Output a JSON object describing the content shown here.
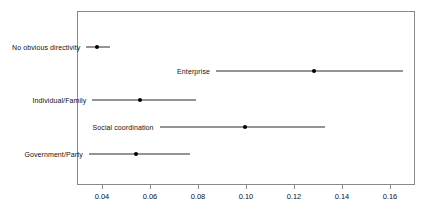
{
  "chart_data": {
    "type": "scatter",
    "subtype": "dot-and-whisker",
    "title": "",
    "subtitle": "",
    "xlabel": "",
    "ylabel": "",
    "xlim": [
      0.028,
      0.1725
    ],
    "ylim": [
      0,
      6
    ],
    "grid": false,
    "legend": null,
    "orientation": "horizontal",
    "xticks": [
      0.04,
      0.06,
      0.08,
      0.1,
      0.12,
      0.14,
      0.16
    ],
    "xticklabels": [
      "0.04",
      "0.06",
      "0.08",
      "0.10",
      "0.12",
      "0.14",
      "0.16"
    ],
    "categories": [
      "No obvious directivity",
      "Enterprise",
      "Individual/Family",
      "Social coordination",
      "Government/Party"
    ],
    "values": [
      0.038,
      0.1285,
      0.0557,
      0.0995,
      0.054
    ],
    "ci_low": [
      0.0335,
      0.0875,
      0.036,
      0.064,
      0.0345
    ],
    "ci_high": [
      0.0433,
      0.1655,
      0.079,
      0.133,
      0.0768
    ],
    "points": [
      {
        "label": "No obvious directivity",
        "estimate": 0.038,
        "ci_low": 0.0335,
        "ci_high": 0.0433
      },
      {
        "label": "Enterprise",
        "estimate": 0.1285,
        "ci_low": 0.0875,
        "ci_high": 0.1655
      },
      {
        "label": "Individual/Family",
        "estimate": 0.0557,
        "ci_low": 0.036,
        "ci_high": 0.079
      },
      {
        "label": "Social coordination",
        "estimate": 0.0995,
        "ci_low": 0.064,
        "ci_high": 0.133
      },
      {
        "label": "Government/Party",
        "estimate": 0.054,
        "ci_low": 0.0345,
        "ci_high": 0.0768
      }
    ],
    "colors": {
      "point": "#000000",
      "whisker": "#2b2b2b",
      "frame": "#8a8a8a",
      "text": "#111111",
      "background": "#ffffff"
    }
  }
}
